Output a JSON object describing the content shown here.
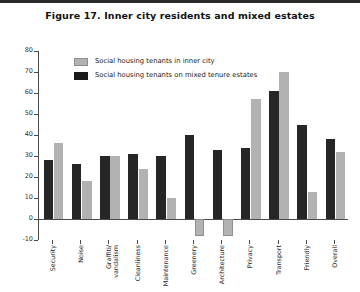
{
  "figure": {
    "title": "Figure 17. Inner city residents and mixed estates"
  },
  "legend": {
    "position": "top-left-inside",
    "entries": [
      {
        "label": "Social housing tenants in inner city",
        "color": "#b2b2b2"
      },
      {
        "label": "Social housing tenants on mixed tenure estates",
        "color": "#1a1a1a"
      }
    ]
  },
  "axis": {
    "y_ticks": [
      "80",
      "70",
      "60",
      "50",
      "40",
      "30",
      "20",
      "10",
      "0",
      "-10"
    ]
  },
  "chart_data": {
    "type": "bar",
    "title": "Figure 17. Inner city residents and mixed estates",
    "xlabel": "",
    "ylabel": "",
    "ylim": [
      -10,
      80
    ],
    "ytick_step": 10,
    "grid": false,
    "legend_position": "upper left",
    "categories": [
      "Security",
      "Noise",
      "Graffiti/ vandalism",
      "Cleanliness",
      "Maintenance",
      "Greenery",
      "Architecture",
      "Privacy",
      "Transport",
      "Friendly",
      "Overall"
    ],
    "series": [
      {
        "name": "Social housing tenants on mixed tenure estates",
        "color": "#262626",
        "values": [
          28,
          26,
          30,
          31,
          30,
          40,
          33,
          34,
          61,
          45,
          38
        ]
      },
      {
        "name": "Social housing tenants in inner city",
        "color": "#b2b2b2",
        "values": [
          36,
          18,
          30,
          24,
          10,
          -8,
          -8,
          57,
          70,
          13,
          32
        ]
      }
    ]
  }
}
